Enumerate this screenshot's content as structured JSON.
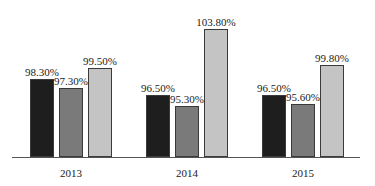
{
  "chart_data": {
    "type": "bar",
    "title": "",
    "xlabel": "",
    "ylabel": "",
    "categories": [
      "2013",
      "2014",
      "2015"
    ],
    "series": [
      {
        "name": "Series 1",
        "color": "#1e1e1e",
        "values": [
          98.3,
          96.5,
          96.5
        ],
        "labels": [
          "98.30%",
          "96.50%",
          "96.50%"
        ]
      },
      {
        "name": "Series 2",
        "color": "#7a7a7a",
        "values": [
          97.3,
          95.3,
          95.6
        ],
        "labels": [
          "97.30%",
          "95.30%",
          "95.60%"
        ]
      },
      {
        "name": "Series 3",
        "color": "#c4c4c4",
        "values": [
          99.5,
          103.8,
          99.8
        ],
        "labels": [
          "99.50%",
          "103.80%",
          "99.80%"
        ]
      }
    ],
    "legend": "none",
    "grid": false
  }
}
